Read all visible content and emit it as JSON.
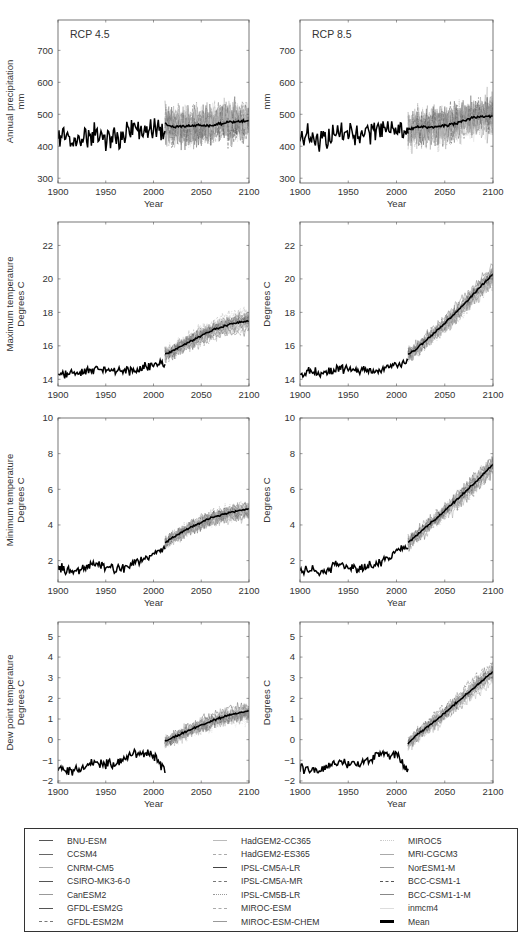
{
  "figure": {
    "panels": [
      {
        "id": "precip-rcp45",
        "row": 0,
        "col": 0,
        "scenario_label": "RCP 4.5",
        "ylabel_lines": [
          "Annual precipitation",
          "mm"
        ],
        "yticks": [
          300,
          400,
          500,
          600,
          700
        ],
        "ylim": [
          285,
          795
        ],
        "xlabel": "Year"
      },
      {
        "id": "precip-rcp85",
        "row": 0,
        "col": 1,
        "scenario_label": "RCP 8.5",
        "ylabel_lines": [
          "mm"
        ],
        "yticks": [
          300,
          400,
          500,
          600,
          700
        ],
        "ylim": [
          285,
          795
        ],
        "xlabel": "Year"
      },
      {
        "id": "tmax-rcp45",
        "row": 1,
        "col": 0,
        "scenario_label": "",
        "ylabel_lines": [
          "Maximum temperature",
          "Degrees C"
        ],
        "yticks": [
          14,
          16,
          18,
          20,
          22
        ],
        "ylim": [
          13.6,
          23.4
        ],
        "xlabel": ""
      },
      {
        "id": "tmax-rcp85",
        "row": 1,
        "col": 1,
        "scenario_label": "",
        "ylabel_lines": [
          "Degrees C"
        ],
        "yticks": [
          14,
          16,
          18,
          20,
          22
        ],
        "ylim": [
          13.6,
          23.4
        ],
        "xlabel": ""
      },
      {
        "id": "tmin-rcp45",
        "row": 2,
        "col": 0,
        "scenario_label": "",
        "ylabel_lines": [
          "Minimum temperature",
          "Degrees C"
        ],
        "yticks": [
          2,
          4,
          6,
          8,
          10
        ],
        "ylim": [
          0.8,
          10
        ],
        "xlabel": "Year"
      },
      {
        "id": "tmin-rcp85",
        "row": 2,
        "col": 1,
        "scenario_label": "",
        "ylabel_lines": [
          "Degrees C"
        ],
        "yticks": [
          2,
          4,
          6,
          8,
          10
        ],
        "ylim": [
          0.8,
          10
        ],
        "xlabel": "Year"
      },
      {
        "id": "dew-rcp45",
        "row": 3,
        "col": 0,
        "scenario_label": "",
        "ylabel_lines": [
          "Dew point temperature",
          "Degrees C"
        ],
        "yticks": [
          -2,
          -1,
          0,
          1,
          2,
          3,
          4,
          5
        ],
        "ylim": [
          -2.1,
          5.7
        ],
        "xlabel": "Year"
      },
      {
        "id": "dew-rcp85",
        "row": 3,
        "col": 1,
        "scenario_label": "",
        "ylabel_lines": [
          "Degrees C"
        ],
        "yticks": [
          -2,
          -1,
          0,
          1,
          2,
          3,
          4,
          5
        ],
        "ylim": [
          -2.1,
          5.7
        ],
        "xlabel": "Year"
      }
    ],
    "xticks": [
      1900,
      1950,
      2000,
      2050,
      2100
    ]
  },
  "legend": {
    "columns": [
      [
        {
          "label": "BNU-ESM",
          "style": "solid",
          "color": "#555555"
        },
        {
          "label": "CCSM4",
          "style": "solid",
          "color": "#666666"
        },
        {
          "label": "CNRM-CM5",
          "style": "solid",
          "color": "#aaaaaa"
        },
        {
          "label": "CSIRO-MK3-6-0",
          "style": "solid",
          "color": "#555555"
        },
        {
          "label": "CanESM2",
          "style": "solid",
          "color": "#999999"
        },
        {
          "label": "GFDL-ESM2G",
          "style": "solid",
          "color": "#555555"
        },
        {
          "label": "GFDL-ESM2M",
          "style": "dashed",
          "color": "#777777"
        }
      ],
      [
        {
          "label": "HadGEM2-CC365",
          "style": "solid",
          "color": "#bbbbbb"
        },
        {
          "label": "HadGEM2-ES365",
          "style": "dashed",
          "color": "#aaaaaa"
        },
        {
          "label": "IPSL-CM5A-LR",
          "style": "solid",
          "color": "#444444"
        },
        {
          "label": "IPSL-CM5A-MR",
          "style": "dashed",
          "color": "#777777"
        },
        {
          "label": "IPSL-CM5B-LR",
          "style": "dotted",
          "color": "#999999"
        },
        {
          "label": "MIROC-ESM",
          "style": "dashed",
          "color": "#aaaaaa"
        },
        {
          "label": "MIROC-ESM-CHEM",
          "style": "solid",
          "color": "#999999"
        }
      ],
      [
        {
          "label": "MIROC5",
          "style": "dotted",
          "color": "#cccccc"
        },
        {
          "label": "MRI-CGCM3",
          "style": "solid",
          "color": "#aaaaaa"
        },
        {
          "label": "NorESM1-M",
          "style": "solid",
          "color": "#999999"
        },
        {
          "label": "BCC-CSM1-1",
          "style": "dashed",
          "color": "#555555"
        },
        {
          "label": "BCC-CSM1-1-M",
          "style": "solid",
          "color": "#888888"
        },
        {
          "label": "inmcm4",
          "style": "solid",
          "color": "#dddddd"
        },
        {
          "label": "Mean",
          "style": "thick",
          "color": "#000000"
        }
      ]
    ]
  },
  "chart_data": [
    {
      "type": "line",
      "title": "RCP 4.5 — Annual precipitation",
      "xlabel": "Year",
      "ylabel": "Annual precipitation (mm)",
      "xlim": [
        1900,
        2100
      ],
      "ylim": [
        285,
        795
      ],
      "x": [
        1900,
        1920,
        1940,
        1960,
        1980,
        2000,
        2012,
        2020,
        2040,
        2060,
        2080,
        2100
      ],
      "series": [
        {
          "name": "Observed",
          "values": [
            430,
            420,
            440,
            425,
            455,
            455,
            440,
            null,
            null,
            null,
            null,
            null
          ]
        },
        {
          "name": "Mean",
          "values": [
            null,
            null,
            null,
            null,
            null,
            null,
            470,
            460,
            465,
            465,
            475,
            480
          ]
        }
      ],
      "annotations": [
        "observed range ~340–600 mm",
        "model spread ~300–750 mm"
      ]
    },
    {
      "type": "line",
      "title": "RCP 8.5 — Annual precipitation",
      "xlabel": "Year",
      "ylabel": "mm",
      "xlim": [
        1900,
        2100
      ],
      "ylim": [
        285,
        795
      ],
      "x": [
        1900,
        1920,
        1940,
        1960,
        1980,
        2000,
        2012,
        2020,
        2040,
        2060,
        2080,
        2100
      ],
      "series": [
        {
          "name": "Observed",
          "values": [
            430,
            420,
            440,
            425,
            455,
            455,
            440,
            null,
            null,
            null,
            null,
            null
          ]
        },
        {
          "name": "Mean",
          "values": [
            null,
            null,
            null,
            null,
            null,
            null,
            450,
            460,
            460,
            470,
            490,
            495
          ]
        }
      ],
      "annotations": [
        "model spread ~290–790 mm"
      ]
    },
    {
      "type": "line",
      "title": "RCP 4.5 — Maximum temperature",
      "xlabel": "",
      "ylabel": "Degrees C",
      "xlim": [
        1900,
        2100
      ],
      "ylim": [
        13.6,
        23.4
      ],
      "x": [
        1900,
        1920,
        1940,
        1960,
        1980,
        2000,
        2012,
        2020,
        2040,
        2060,
        2080,
        2100
      ],
      "series": [
        {
          "name": "Observed",
          "values": [
            14.4,
            14.4,
            14.6,
            14.6,
            14.5,
            14.9,
            15.0,
            null,
            null,
            null,
            null,
            null
          ]
        },
        {
          "name": "Mean",
          "values": [
            null,
            null,
            null,
            null,
            null,
            null,
            15.5,
            15.7,
            16.3,
            16.9,
            17.3,
            17.5
          ]
        }
      ]
    },
    {
      "type": "line",
      "title": "RCP 8.5 — Maximum temperature",
      "xlabel": "",
      "ylabel": "Degrees C",
      "xlim": [
        1900,
        2100
      ],
      "ylim": [
        13.6,
        23.4
      ],
      "x": [
        1900,
        1920,
        1940,
        1960,
        1980,
        2000,
        2012,
        2020,
        2040,
        2060,
        2080,
        2100
      ],
      "series": [
        {
          "name": "Observed",
          "values": [
            14.4,
            14.4,
            14.6,
            14.6,
            14.5,
            14.9,
            15.0,
            null,
            null,
            null,
            null,
            null
          ]
        },
        {
          "name": "Mean",
          "values": [
            null,
            null,
            null,
            null,
            null,
            null,
            15.5,
            15.8,
            16.8,
            17.9,
            19.1,
            20.3
          ]
        }
      ]
    },
    {
      "type": "line",
      "title": "RCP 4.5 — Minimum temperature",
      "xlabel": "Year",
      "ylabel": "Degrees C",
      "xlim": [
        1900,
        2100
      ],
      "ylim": [
        0.8,
        10
      ],
      "x": [
        1900,
        1920,
        1940,
        1960,
        1980,
        2000,
        2012,
        2020,
        2040,
        2060,
        2080,
        2100
      ],
      "series": [
        {
          "name": "Observed",
          "values": [
            1.5,
            1.4,
            1.8,
            1.5,
            1.8,
            2.4,
            2.7,
            null,
            null,
            null,
            null,
            null
          ]
        },
        {
          "name": "Mean",
          "values": [
            null,
            null,
            null,
            null,
            null,
            null,
            3.0,
            3.3,
            3.9,
            4.4,
            4.7,
            4.9
          ]
        }
      ]
    },
    {
      "type": "line",
      "title": "RCP 8.5 — Minimum temperature",
      "xlabel": "Year",
      "ylabel": "Degrees C",
      "xlim": [
        1900,
        2100
      ],
      "ylim": [
        0.8,
        10
      ],
      "x": [
        1900,
        1920,
        1940,
        1960,
        1980,
        2000,
        2012,
        2020,
        2040,
        2060,
        2080,
        2100
      ],
      "series": [
        {
          "name": "Observed",
          "values": [
            1.5,
            1.4,
            1.8,
            1.5,
            1.8,
            2.4,
            2.7,
            null,
            null,
            null,
            null,
            null
          ]
        },
        {
          "name": "Mean",
          "values": [
            null,
            null,
            null,
            null,
            null,
            null,
            3.0,
            3.4,
            4.3,
            5.3,
            6.3,
            7.4
          ]
        }
      ]
    },
    {
      "type": "line",
      "title": "RCP 4.5 — Dew point temperature",
      "xlabel": "Year",
      "ylabel": "Degrees C",
      "xlim": [
        1900,
        2100
      ],
      "ylim": [
        -2.1,
        5.7
      ],
      "x": [
        1900,
        1920,
        1940,
        1960,
        1980,
        2000,
        2012,
        2020,
        2040,
        2060,
        2080,
        2100
      ],
      "series": [
        {
          "name": "Observed",
          "values": [
            -1.4,
            -1.5,
            -1.1,
            -1.2,
            -0.7,
            -0.7,
            -1.5,
            null,
            null,
            null,
            null,
            null
          ]
        },
        {
          "name": "Mean",
          "values": [
            null,
            null,
            null,
            null,
            null,
            null,
            -0.1,
            0.1,
            0.5,
            0.9,
            1.2,
            1.4
          ]
        }
      ]
    },
    {
      "type": "line",
      "title": "RCP 8.5 — Dew point temperature",
      "xlabel": "Year",
      "ylabel": "Degrees C",
      "xlim": [
        1900,
        2100
      ],
      "ylim": [
        -2.1,
        5.7
      ],
      "x": [
        1900,
        1920,
        1940,
        1960,
        1980,
        2000,
        2012,
        2020,
        2040,
        2060,
        2080,
        2100
      ],
      "series": [
        {
          "name": "Observed",
          "values": [
            -1.4,
            -1.5,
            -1.1,
            -1.2,
            -0.7,
            -0.7,
            -1.5,
            null,
            null,
            null,
            null,
            null
          ]
        },
        {
          "name": "Mean",
          "values": [
            null,
            null,
            null,
            null,
            null,
            null,
            -0.2,
            0.2,
            0.9,
            1.7,
            2.5,
            3.3
          ]
        }
      ]
    }
  ]
}
